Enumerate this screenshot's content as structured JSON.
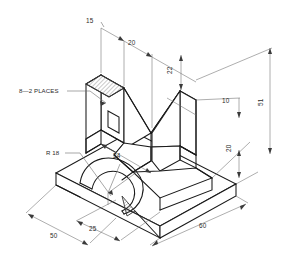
{
  "drawing": {
    "title": "Isometric V-Block Part Drawing",
    "type": "isometric-technical-drawing",
    "units": "mm",
    "background_color": "#ffffff",
    "line_color": "#1a1a1a",
    "dimension_color": "#6b6b6b",
    "text_color": "#2a2a2a"
  },
  "dimensions": [
    {
      "id": "d15",
      "label": "15",
      "orientation": "top-left-horizontal",
      "x": 92,
      "y": 23
    },
    {
      "id": "d20a",
      "label": "20",
      "orientation": "top-horizontal",
      "x": 133,
      "y": 43
    },
    {
      "id": "d22",
      "label": "22",
      "orientation": "right-vertical",
      "x": 178,
      "y": 70
    },
    {
      "id": "d10",
      "label": "10",
      "orientation": "right-vertical",
      "x": 228,
      "y": 104
    },
    {
      "id": "d20b",
      "label": "20",
      "orientation": "right-vertical",
      "x": 235,
      "y": 146
    },
    {
      "id": "d51",
      "label": "51",
      "orientation": "far-right-vertical",
      "x": 271,
      "y": 103
    },
    {
      "id": "d34",
      "label": "34",
      "orientation": "mid-diagonal",
      "x": 119,
      "y": 158
    },
    {
      "id": "d50",
      "label": "50",
      "orientation": "bottom-left-diagonal",
      "x": 55,
      "y": 237
    },
    {
      "id": "d25",
      "label": "25",
      "orientation": "bottom-mid-diagonal",
      "x": 95,
      "y": 229
    },
    {
      "id": "d60",
      "label": "60",
      "orientation": "bottom-right-diagonal",
      "x": 206,
      "y": 225
    }
  ],
  "annotations": [
    {
      "id": "note-places",
      "label": "8—2 PLACES",
      "x": 20,
      "y": 93,
      "leader_to": [
        104,
        102
      ]
    },
    {
      "id": "note-radius",
      "label": "R 18",
      "x": 47,
      "y": 155,
      "leader_to": [
        96,
        178
      ]
    }
  ],
  "icons": {
    "arrow_marker": "dimension-arrowhead",
    "hatch_pattern": "section-hatch"
  }
}
